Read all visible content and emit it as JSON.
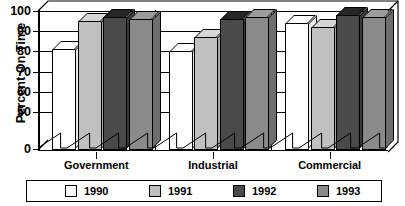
{
  "chart_data": {
    "type": "bar",
    "title": "",
    "xlabel": "",
    "ylabel": "Percent On Time",
    "categories": [
      "Government",
      "Industrial",
      "Commercial"
    ],
    "series": [
      {
        "name": "1990",
        "values": [
          81,
          80,
          94
        ],
        "color": "#ffffff"
      },
      {
        "name": "1991",
        "values": [
          95,
          87,
          92
        ],
        "color": "#c0c0c0"
      },
      {
        "name": "1992",
        "values": [
          97,
          96,
          98
        ],
        "color": "#4a4a4a"
      },
      {
        "name": "1993",
        "values": [
          96,
          97,
          97
        ],
        "color": "#8a8a8a"
      }
    ],
    "ylim": [
      0,
      100
    ],
    "ytick_labels": [
      "0",
      "50",
      "60",
      "70",
      "80",
      "90",
      "100"
    ],
    "ytick_values": [
      0,
      50,
      60,
      70,
      80,
      90,
      100
    ],
    "axis_break": true,
    "axis_break_range": [
      0,
      50
    ],
    "grid": true,
    "legend_position": "bottom",
    "style": "3d-bar"
  },
  "axis": {
    "y_title": "Percent On Time",
    "ticks": [
      {
        "label": "100",
        "value": 100
      },
      {
        "label": "90",
        "value": 90
      },
      {
        "label": "80",
        "value": 80
      },
      {
        "label": "70",
        "value": 70
      },
      {
        "label": "60",
        "value": 60
      },
      {
        "label": "50",
        "value": 50
      },
      {
        "label": "0",
        "value": 0
      }
    ]
  },
  "categories": [
    {
      "label": "Government"
    },
    {
      "label": "Industrial"
    },
    {
      "label": "Commercial"
    }
  ],
  "legend": {
    "entries": [
      {
        "label": "1990",
        "color": "#ffffff"
      },
      {
        "label": "1991",
        "color": "#c0c0c0"
      },
      {
        "label": "1992",
        "color": "#4a4a4a"
      },
      {
        "label": "1993",
        "color": "#8a8a8a"
      }
    ]
  }
}
